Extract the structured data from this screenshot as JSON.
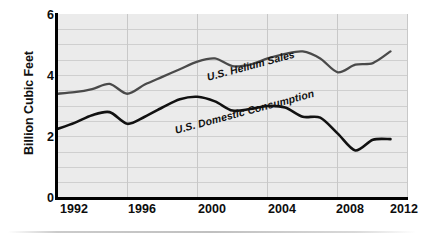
{
  "chart_data": {
    "type": "line",
    "title": "",
    "xlabel": "",
    "ylabel": "Billion Cubic Feet",
    "xlim": [
      1992,
      2012
    ],
    "ylim": [
      0,
      6
    ],
    "x_ticks": [
      1992,
      1996,
      2000,
      2004,
      2008,
      2012
    ],
    "y_ticks": [
      0,
      2,
      4,
      6
    ],
    "grid": "both, minor horizontal every 0.5, vertical every 4 years",
    "legend": "inline labels on curves",
    "x": [
      1992,
      1993,
      1994,
      1995,
      1996,
      1997,
      1998,
      1999,
      2000,
      2001,
      2002,
      2003,
      2004,
      2005,
      2006,
      2007,
      2008,
      2009,
      2010,
      2011
    ],
    "series": [
      {
        "name": "U.S. Helium Sales",
        "color": "#4a4a4a",
        "values": [
          3.4,
          3.45,
          3.55,
          3.72,
          3.4,
          3.7,
          3.95,
          4.2,
          4.45,
          4.55,
          4.3,
          4.35,
          4.55,
          4.7,
          4.78,
          4.55,
          4.1,
          4.35,
          4.4,
          4.78
        ]
      },
      {
        "name": "U.S. Domestic Consumption",
        "color": "#111111",
        "values": [
          2.25,
          2.45,
          2.7,
          2.8,
          2.42,
          2.65,
          2.95,
          3.22,
          3.3,
          3.15,
          2.85,
          2.9,
          3.0,
          2.95,
          2.65,
          2.62,
          2.1,
          1.55,
          1.9,
          1.92
        ]
      }
    ]
  },
  "axes": {
    "y_title": "Billion Cubic Feet",
    "y_tick_labels": [
      "6",
      "4",
      "2",
      "0"
    ],
    "x_tick_labels": [
      "1992",
      "1996",
      "2000",
      "2004",
      "2008",
      "2012"
    ]
  },
  "labels": {
    "helium": "U.S. Helium Sales",
    "domestic": "U.S. Domestic Consumption"
  },
  "colors": {
    "plot_background": "#ebebeb",
    "axis": "#000000",
    "gridline": "#cfcfcf",
    "helium_line": "#4a4a4a",
    "domestic_line": "#111111"
  }
}
